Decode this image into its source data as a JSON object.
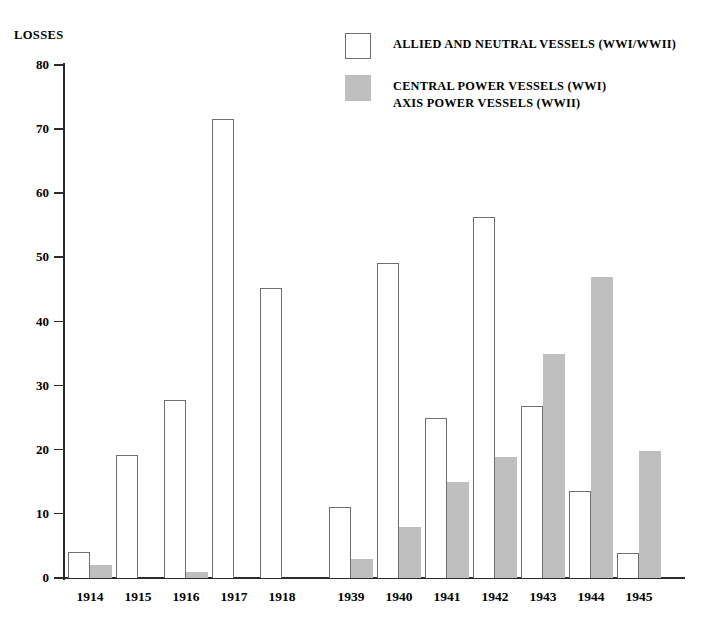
{
  "chart_data": {
    "type": "bar",
    "title": "",
    "subtitle": "",
    "xlabel": "",
    "ylabel": "LOSSES",
    "ylim": [
      0,
      80
    ],
    "yticks": [
      0,
      10,
      20,
      30,
      40,
      50,
      60,
      70,
      80
    ],
    "ytick_labels": [
      "0",
      "10",
      "20",
      "30",
      "40",
      "50",
      "60",
      "70",
      "80"
    ],
    "grid": false,
    "legend_position": "top-center",
    "categories": [
      "1914",
      "1915",
      "1916",
      "1917",
      "1918",
      "1939",
      "1940",
      "1941",
      "1942",
      "1943",
      "1944",
      "1945"
    ],
    "series": [
      {
        "name": "ALLIED AND NEUTRAL VESSELS (WWI/WWII)",
        "color": "#ffffff",
        "edge_color": "#6e6e6e",
        "values": [
          4.1,
          19.2,
          27.7,
          71.6,
          45.2,
          11.0,
          49.2,
          25.0,
          56.3,
          26.8,
          13.5,
          3.9
        ]
      },
      {
        "name": "CENTRAL POWER VESSELS (WWI) / AXIS POWER VESSELS (WWII)",
        "color": "#bfbfbf",
        "edge_color": "#bfbfbf",
        "values": [
          2.0,
          0.0,
          1.0,
          0.0,
          0.0,
          2.9,
          8.0,
          15.0,
          18.9,
          35.0,
          47.0,
          19.8
        ]
      }
    ],
    "annotations": []
  },
  "axis": {
    "y_title": "LOSSES"
  },
  "legend": {
    "entries": [
      {
        "swatch": "allied",
        "line1": "ALLIED AND NEUTRAL VESSELS (WWI/WWII)",
        "line2": ""
      },
      {
        "swatch": "axis",
        "line1": "CENTRAL POWER VESSELS (WWI)",
        "line2": "AXIS POWER VESSELS (WWII)"
      }
    ]
  },
  "colors": {
    "allied_fill": "#ffffff",
    "allied_edge": "#6e6e6e",
    "axis_fill": "#bfbfbf",
    "axis_line": "#2b2b2b",
    "background": "#ffffff"
  }
}
